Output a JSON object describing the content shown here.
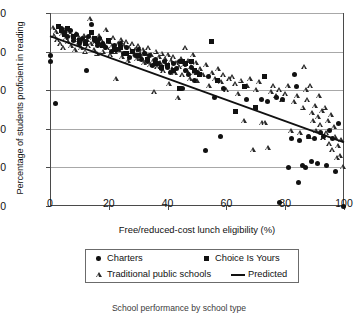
{
  "chart_data": {
    "type": "scatter",
    "title": "School performance by school type",
    "xlabel": "Free/reduced-cost lunch eligibility (%)",
    "ylabel": "Percentage of students proficient in reading",
    "xlim": [
      0,
      100
    ],
    "ylim": [
      0,
      100
    ],
    "xticks": [
      0,
      20,
      40,
      60,
      80,
      100
    ],
    "yticks": [
      0,
      20,
      40,
      60,
      80,
      100
    ],
    "grid": "horizontal",
    "legend_position": "below-axis",
    "series": [
      {
        "name": "Traditional public schools",
        "marker": "open-triangle",
        "color": "#2a2a2a",
        "points": [
          [
            1,
            92
          ],
          [
            1.5,
            88
          ],
          [
            2,
            90
          ],
          [
            2.5,
            86
          ],
          [
            3,
            93
          ],
          [
            3.5,
            84
          ],
          [
            4,
            89
          ],
          [
            4.5,
            82
          ],
          [
            5,
            91
          ],
          [
            5.5,
            87
          ],
          [
            6,
            85
          ],
          [
            6.5,
            90
          ],
          [
            7,
            83
          ],
          [
            7.5,
            88
          ],
          [
            8,
            86
          ],
          [
            8.5,
            81
          ],
          [
            9,
            89
          ],
          [
            9.5,
            84
          ],
          [
            10,
            87
          ],
          [
            10.5,
            82
          ],
          [
            11,
            85
          ],
          [
            11.5,
            88
          ],
          [
            12,
            80
          ],
          [
            12.5,
            86
          ],
          [
            13,
            83
          ],
          [
            13.5,
            97
          ],
          [
            14,
            84
          ],
          [
            14.5,
            87
          ],
          [
            15,
            81
          ],
          [
            15.5,
            85
          ],
          [
            16,
            79
          ],
          [
            16.5,
            88
          ],
          [
            17,
            83
          ],
          [
            17.5,
            86
          ],
          [
            18,
            80
          ],
          [
            18.5,
            84
          ],
          [
            19,
            91
          ],
          [
            19.5,
            82
          ],
          [
            20,
            85
          ],
          [
            20.5,
            78
          ],
          [
            21,
            83
          ],
          [
            21.5,
            87
          ],
          [
            22,
            80
          ],
          [
            22.5,
            66
          ],
          [
            23,
            84
          ],
          [
            23.5,
            81
          ],
          [
            24,
            86
          ],
          [
            24.5,
            77
          ],
          [
            25,
            83
          ],
          [
            25.5,
            79
          ],
          [
            26,
            85
          ],
          [
            26.5,
            75
          ],
          [
            27,
            82
          ],
          [
            27.5,
            80
          ],
          [
            28,
            84
          ],
          [
            28.5,
            78
          ],
          [
            29,
            81
          ],
          [
            29.5,
            76
          ],
          [
            30,
            83
          ],
          [
            30.5,
            79
          ],
          [
            31,
            77
          ],
          [
            31.5,
            81
          ],
          [
            32,
            74
          ],
          [
            32.5,
            79
          ],
          [
            33,
            76
          ],
          [
            33.5,
            82
          ],
          [
            34,
            73
          ],
          [
            34.5,
            78
          ],
          [
            35,
            75
          ],
          [
            35.5,
            59
          ],
          [
            36,
            80
          ],
          [
            36.5,
            72
          ],
          [
            37,
            77
          ],
          [
            37.5,
            74
          ],
          [
            38,
            79
          ],
          [
            38.5,
            70
          ],
          [
            39,
            76
          ],
          [
            39.5,
            73
          ],
          [
            40,
            78
          ],
          [
            40.5,
            63
          ],
          [
            41,
            75
          ],
          [
            41.5,
            71
          ],
          [
            42,
            77
          ],
          [
            42.5,
            69
          ],
          [
            43,
            74
          ],
          [
            43.5,
            56
          ],
          [
            44,
            72
          ],
          [
            44.5,
            76
          ],
          [
            45,
            68
          ],
          [
            45.5,
            73
          ],
          [
            46,
            82
          ],
          [
            46.5,
            70
          ],
          [
            47,
            75
          ],
          [
            47.5,
            66
          ],
          [
            48,
            72
          ],
          [
            48.5,
            78
          ],
          [
            49,
            69
          ],
          [
            49.5,
            74
          ],
          [
            50,
            65
          ],
          [
            51,
            71
          ],
          [
            52,
            68
          ],
          [
            53,
            73
          ],
          [
            54,
            62
          ],
          [
            55,
            69
          ],
          [
            56,
            66
          ],
          [
            57,
            71
          ],
          [
            58,
            64
          ],
          [
            59,
            68
          ],
          [
            60,
            60
          ],
          [
            61,
            66
          ],
          [
            62,
            67
          ],
          [
            63,
            63
          ],
          [
            64,
            58
          ],
          [
            65,
            65
          ],
          [
            66,
            44
          ],
          [
            67,
            62
          ],
          [
            68,
            66
          ],
          [
            69,
            29
          ],
          [
            70,
            60
          ],
          [
            71,
            64
          ],
          [
            72,
            43
          ],
          [
            73,
            43
          ],
          [
            74,
            30
          ],
          [
            75,
            59
          ],
          [
            76,
            62
          ],
          [
            77,
            57
          ],
          [
            78,
            60
          ],
          [
            79,
            55
          ],
          [
            80,
            58
          ],
          [
            81,
            62
          ],
          [
            82,
            39
          ],
          [
            83,
            54
          ],
          [
            84,
            57
          ],
          [
            85,
            38
          ],
          [
            86,
            51
          ],
          [
            86.5,
            72
          ],
          [
            87,
            60
          ],
          [
            87.5,
            55
          ],
          [
            88,
            36
          ],
          [
            88.5,
            62
          ],
          [
            89,
            48
          ],
          [
            89.5,
            44
          ],
          [
            90,
            52
          ],
          [
            90.5,
            39
          ],
          [
            91,
            46
          ],
          [
            91.5,
            57
          ],
          [
            92,
            42
          ],
          [
            92.5,
            49
          ],
          [
            93,
            35
          ],
          [
            93.5,
            51
          ],
          [
            94,
            38
          ],
          [
            94.5,
            44
          ],
          [
            95,
            32
          ],
          [
            95.5,
            47
          ],
          [
            96,
            29
          ],
          [
            96.5,
            41
          ],
          [
            97,
            36
          ],
          [
            97.5,
            25
          ],
          [
            98,
            31
          ],
          [
            98.5,
            26
          ],
          [
            99,
            34
          ],
          [
            99.5,
            20
          ]
        ]
      },
      {
        "name": "Charters",
        "marker": "filled-circle",
        "color": "#111111",
        "points": [
          [
            0.3,
            78
          ],
          [
            0.3,
            75
          ],
          [
            2,
            53
          ],
          [
            4,
            92
          ],
          [
            5,
            90
          ],
          [
            6,
            88
          ],
          [
            7,
            91
          ],
          [
            8,
            86
          ],
          [
            9,
            89
          ],
          [
            10,
            84
          ],
          [
            11,
            87
          ],
          [
            12,
            85
          ],
          [
            12.5,
            70
          ],
          [
            13,
            88
          ],
          [
            14,
            94
          ],
          [
            15,
            86
          ],
          [
            16,
            83
          ],
          [
            17,
            87
          ],
          [
            18,
            84
          ],
          [
            19,
            82
          ],
          [
            20,
            85
          ],
          [
            21,
            80
          ],
          [
            22,
            83
          ],
          [
            23,
            81
          ],
          [
            24,
            84
          ],
          [
            25,
            79
          ],
          [
            26,
            82
          ],
          [
            27,
            77
          ],
          [
            28,
            80
          ],
          [
            29,
            78
          ],
          [
            30,
            81
          ],
          [
            31,
            76
          ],
          [
            32,
            79
          ],
          [
            33,
            75
          ],
          [
            34,
            78
          ],
          [
            35,
            73
          ],
          [
            36,
            76
          ],
          [
            37,
            74
          ],
          [
            38,
            71
          ],
          [
            39,
            75
          ],
          [
            40,
            72
          ],
          [
            41,
            69
          ],
          [
            42,
            74
          ],
          [
            43,
            71
          ],
          [
            44,
            75
          ],
          [
            45,
            61
          ],
          [
            46,
            70
          ],
          [
            47,
            68
          ],
          [
            48,
            72
          ],
          [
            49,
            65
          ],
          [
            50,
            69
          ],
          [
            53,
            29
          ],
          [
            54,
            67
          ],
          [
            56,
            56
          ],
          [
            58,
            36
          ],
          [
            59,
            61
          ],
          [
            63,
            49
          ],
          [
            67,
            55
          ],
          [
            70,
            51
          ],
          [
            72,
            55
          ],
          [
            74,
            54
          ],
          [
            77,
            56
          ],
          [
            78,
            2
          ],
          [
            79,
            55
          ],
          [
            81,
            20
          ],
          [
            82,
            35
          ],
          [
            83,
            68
          ],
          [
            84,
            62
          ],
          [
            84.5,
            12
          ],
          [
            85,
            34
          ],
          [
            86,
            21
          ],
          [
            87,
            20
          ],
          [
            88,
            36
          ],
          [
            89,
            23
          ],
          [
            90,
            35
          ],
          [
            91,
            22
          ],
          [
            92,
            38
          ],
          [
            93,
            36
          ],
          [
            94,
            21
          ],
          [
            95,
            39
          ],
          [
            96,
            35
          ],
          [
            97,
            18
          ],
          [
            98,
            43
          ],
          [
            99.7,
            0
          ]
        ]
      },
      {
        "name": "Choice Is Yours",
        "marker": "filled-square",
        "color": "#111111",
        "points": [
          [
            3,
            93
          ],
          [
            4,
            91
          ],
          [
            5,
            89
          ],
          [
            6,
            92
          ],
          [
            8,
            88
          ],
          [
            10,
            86
          ],
          [
            12,
            84
          ],
          [
            14,
            90
          ],
          [
            15,
            87
          ],
          [
            16,
            85
          ],
          [
            18,
            83
          ],
          [
            20,
            86
          ],
          [
            22,
            81
          ],
          [
            24,
            82
          ],
          [
            26,
            79
          ],
          [
            28,
            80
          ],
          [
            30,
            78
          ],
          [
            33,
            76
          ],
          [
            36,
            74
          ],
          [
            38,
            72
          ],
          [
            40,
            73
          ],
          [
            42,
            70
          ],
          [
            44,
            61
          ],
          [
            45,
            75
          ],
          [
            46,
            74
          ],
          [
            48,
            75
          ],
          [
            49,
            70
          ],
          [
            51,
            68
          ],
          [
            55,
            85
          ],
          [
            57,
            65
          ],
          [
            63,
            49
          ],
          [
            66,
            62
          ],
          [
            70,
            51
          ],
          [
            73,
            67
          ]
        ]
      }
    ],
    "trendline": {
      "name": "Predicted",
      "style": "solid",
      "color": "#111111",
      "x0": 0,
      "y0": 88,
      "x1": 100,
      "y1": 33
    },
    "legend": [
      {
        "label": "Charters",
        "marker": "filled-circle"
      },
      {
        "label": "Choice Is Yours",
        "marker": "filled-square"
      },
      {
        "label": "Traditional public schools",
        "marker": "open-triangle"
      },
      {
        "label": "Predicted",
        "marker": "line"
      }
    ]
  }
}
